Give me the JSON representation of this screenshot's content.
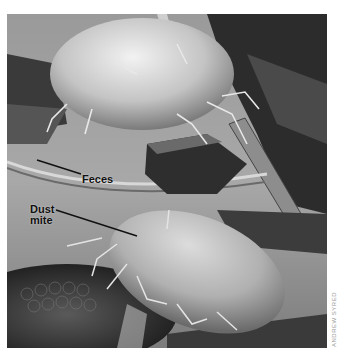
{
  "figure": {
    "labels": {
      "feces": "Feces",
      "dust_mite_line1": "Dust",
      "dust_mite_line2": "mite"
    },
    "credit": "ANDREW SYRED",
    "colors": {
      "label_text": "#111111",
      "leader_line": "#111111",
      "credit_text": "#9a9a9a",
      "background": "#ffffff"
    }
  }
}
